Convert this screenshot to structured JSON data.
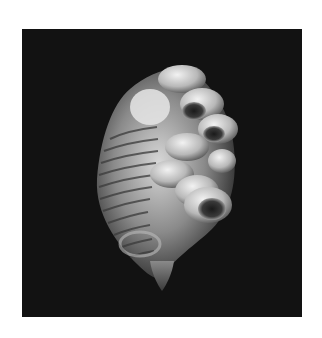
{
  "image": {
    "subject": "seashell encrusted with barnacles",
    "alt": "Black and white photograph of a spiral seashell covered with barnacles on a black background",
    "style": "monochrome",
    "background_color": "#121212",
    "frame_color": "#ffffff"
  }
}
